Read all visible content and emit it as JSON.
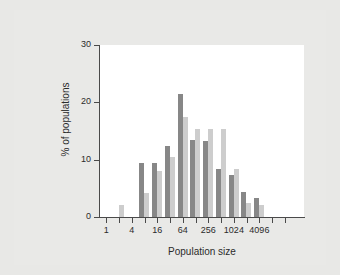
{
  "figure": {
    "background_color": "#e8e8e6",
    "plot_background_color": "#ffffff",
    "axis_color": "#4a4a4a"
  },
  "chart_data": {
    "type": "bar",
    "title": "",
    "subtitle": "",
    "xlabel": "Population size",
    "ylabel": "% of populations",
    "grid": false,
    "legend": "none",
    "x_scale": "log2",
    "xlim": [
      0,
      16
    ],
    "ylim": [
      0,
      30
    ],
    "y_ticks": [
      0,
      10,
      20,
      30
    ],
    "y_tick_labels": [
      "0",
      "10",
      "20",
      "30"
    ],
    "x_tick_labels": [
      "1",
      "4",
      "16",
      "64",
      "256",
      "1024",
      "4096"
    ],
    "x_tick_label_positions": [
      0,
      2,
      4,
      6,
      8,
      10,
      12
    ],
    "x_minor_tick_positions": [
      1,
      3,
      5,
      7,
      9,
      11,
      13,
      14
    ],
    "categories": [
      "1",
      "2",
      "4",
      "8",
      "16",
      "32",
      "64",
      "128",
      "256",
      "512",
      "1024",
      "2048",
      "4096",
      "8192"
    ],
    "bar_colors": {
      "series1": "#878787",
      "series2": "#cdcdcd"
    },
    "series": [
      {
        "name": "series1",
        "color": "#878787",
        "values": [
          0,
          0,
          0,
          9.4,
          9.5,
          12.3,
          21.5,
          13.4,
          13.3,
          8.4,
          7.3,
          4.4,
          3.4,
          0
        ]
      },
      {
        "name": "series2",
        "color": "#cdcdcd",
        "values": [
          0,
          2.1,
          0,
          4.2,
          8.0,
          10.5,
          17.5,
          15.4,
          15.3,
          15.4,
          8.4,
          2.4,
          2.1,
          0
        ]
      }
    ]
  },
  "axes": {
    "y_title": "% of populations",
    "x_title": "Population size"
  }
}
